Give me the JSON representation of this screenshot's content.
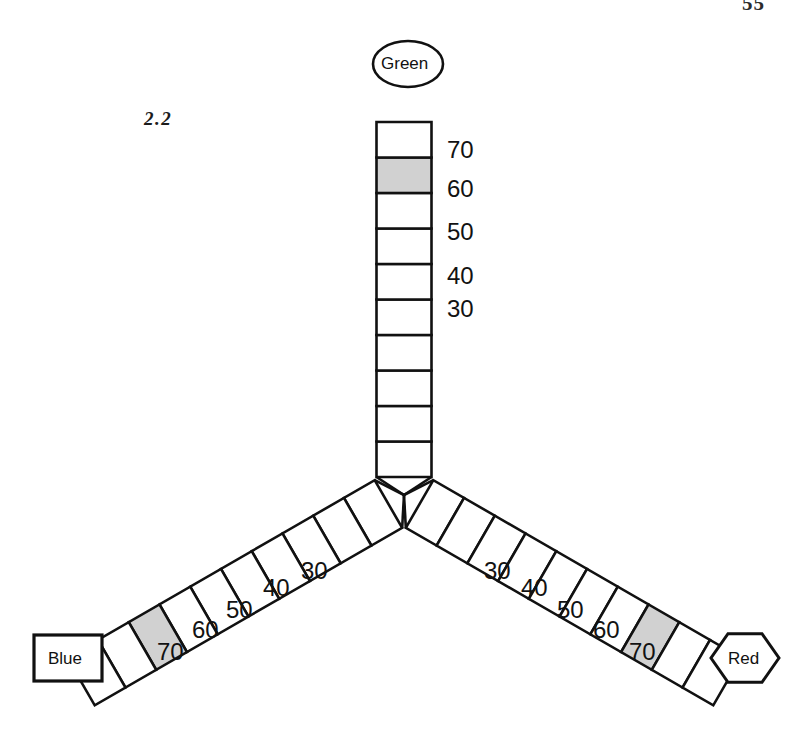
{
  "page": {
    "page_number": "55",
    "figure_id": "2.2",
    "background_color": "#ffffff",
    "ink_color": "#111111",
    "shade_color": "#c9c9c9"
  },
  "diagram": {
    "type": "ternary-y-scale",
    "center": {
      "x": 404,
      "y": 495
    },
    "arms": [
      {
        "id": "green",
        "node_label": "Green",
        "node_shape": "ellipse",
        "node_center": {
          "x": 408,
          "y": 64
        },
        "direction_degrees": 90,
        "cell_count": 10,
        "shaded_cell_index": 8,
        "reading": 62,
        "ticks": [
          {
            "value": "70",
            "x": 447,
            "y": 138
          },
          {
            "value": "60",
            "x": 447,
            "y": 177
          },
          {
            "value": "50",
            "x": 447,
            "y": 220
          },
          {
            "value": "40",
            "x": 447,
            "y": 264
          },
          {
            "value": "30",
            "x": 447,
            "y": 297
          }
        ]
      },
      {
        "id": "blue",
        "node_label": "Blue",
        "node_shape": "rectangle",
        "node_center": {
          "x": 68,
          "y": 658
        },
        "direction_degrees": 210,
        "cell_count": 10,
        "shaded_cell_index": 7,
        "reading": 44,
        "ticks": [
          {
            "value": "30",
            "x": 301,
            "y": 559
          },
          {
            "value": "40",
            "x": 263,
            "y": 576
          },
          {
            "value": "50",
            "x": 226,
            "y": 598
          },
          {
            "value": "60",
            "x": 192,
            "y": 618
          },
          {
            "value": "70",
            "x": 157,
            "y": 640
          }
        ]
      },
      {
        "id": "red",
        "node_label": "Red",
        "node_shape": "hexagon",
        "node_center": {
          "x": 745,
          "y": 658
        },
        "direction_degrees": 330,
        "cell_count": 10,
        "shaded_cell_index": 7,
        "reading": 47,
        "ticks": [
          {
            "value": "30",
            "x": 484,
            "y": 559
          },
          {
            "value": "40",
            "x": 521,
            "y": 576
          },
          {
            "value": "50",
            "x": 557,
            "y": 598
          },
          {
            "value": "60",
            "x": 593,
            "y": 618
          },
          {
            "value": "70",
            "x": 629,
            "y": 640
          }
        ]
      }
    ]
  },
  "chart_data": {
    "type": "table",
    "categories": [
      "Green",
      "Blue",
      "Red"
    ],
    "values": [
      62,
      44,
      47
    ],
    "xlabel": "Arm",
    "ylabel": "Scale reading",
    "ylim": [
      20,
      80
    ],
    "axis_tick_values": [
      30,
      40,
      50,
      60,
      70
    ],
    "grid": false,
    "legend": "none"
  }
}
